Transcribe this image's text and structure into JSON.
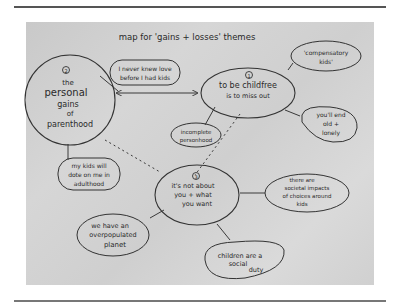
{
  "diagram": {
    "title": "map for 'gains + losses' themes",
    "nodes": [
      {
        "id": "parenthood",
        "number": "2",
        "lines": [
          "the",
          "personal",
          "gains",
          "of",
          "parenthood"
        ]
      },
      {
        "id": "childfree",
        "number": "1",
        "lines": [
          "to be childfree",
          "is to miss out"
        ]
      },
      {
        "id": "not-about-you",
        "number": "3",
        "lines": [
          "it's not about",
          "you + what",
          "you want"
        ]
      },
      {
        "id": "never-knew-love",
        "lines": [
          "I never knew love",
          "before I had kids"
        ]
      },
      {
        "id": "compensatory",
        "lines": [
          "'compensatory",
          "kids'"
        ]
      },
      {
        "id": "old-lonely",
        "lines": [
          "you'll end",
          "old +",
          "lonely"
        ]
      },
      {
        "id": "incomplete",
        "lines": [
          "incomplete",
          "personhood"
        ]
      },
      {
        "id": "dote",
        "lines": [
          "my kids will",
          "dote on me in",
          "adulthood"
        ]
      },
      {
        "id": "societal",
        "lines": [
          "there are",
          "societal impacts",
          "of choices around",
          "kids"
        ]
      },
      {
        "id": "overpopulated",
        "lines": [
          "we have an",
          "overpopulated",
          "planet"
        ]
      },
      {
        "id": "social-duty",
        "lines": [
          "children are a",
          "social",
          "duty"
        ]
      }
    ],
    "edges": [
      {
        "from": "parenthood",
        "to": "childfree",
        "style": "double-arrow"
      },
      {
        "from": "parenthood",
        "to": "never-knew-love",
        "style": "solid"
      },
      {
        "from": "parenthood",
        "to": "dote",
        "style": "solid"
      },
      {
        "from": "childfree",
        "to": "compensatory",
        "style": "solid"
      },
      {
        "from": "childfree",
        "to": "old-lonely",
        "style": "solid"
      },
      {
        "from": "childfree",
        "to": "incomplete",
        "style": "solid"
      },
      {
        "from": "childfree",
        "to": "not-about-you",
        "style": "dashed"
      },
      {
        "from": "parenthood",
        "to": "not-about-you",
        "style": "dashed"
      },
      {
        "from": "not-about-you",
        "to": "societal",
        "style": "solid"
      },
      {
        "from": "not-about-you",
        "to": "overpopulated",
        "style": "solid"
      },
      {
        "from": "not-about-you",
        "to": "social-duty",
        "style": "solid"
      }
    ]
  }
}
